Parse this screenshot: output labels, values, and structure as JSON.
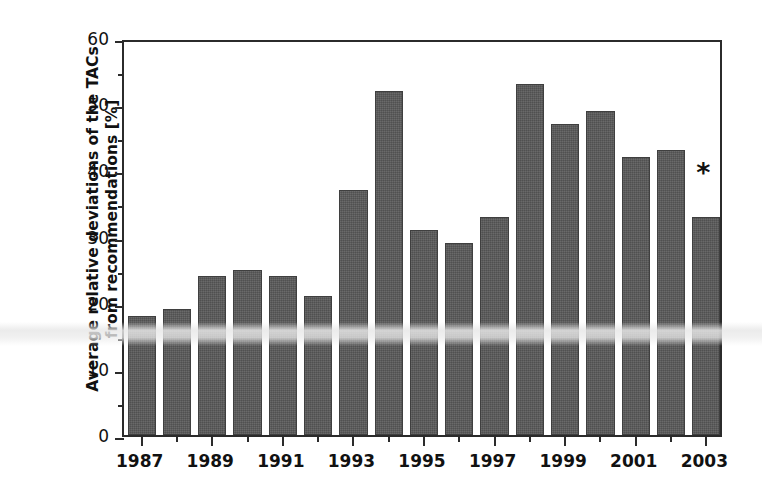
{
  "chart_data": {
    "type": "bar",
    "title": "",
    "subtitle": "",
    "xlabel": "",
    "ylabel": "Average relative deviations of the TACs from recommendations [%]",
    "ylabel_line1": "Average relative deviations of the TACs",
    "ylabel_line2": "from recommendations [%]",
    "categories": [
      "1987",
      "1988",
      "1989",
      "1990",
      "1991",
      "1992",
      "1993",
      "1994",
      "1995",
      "1996",
      "1997",
      "1998",
      "1999",
      "2000",
      "2001",
      "2002",
      "2003"
    ],
    "values": [
      18,
      19,
      24,
      25,
      24,
      21,
      37,
      52,
      31,
      29,
      33,
      53,
      47,
      49,
      42,
      43,
      33
    ],
    "ylim": [
      0,
      60
    ],
    "y_ticks": [
      0,
      10,
      20,
      30,
      40,
      50,
      60
    ],
    "y_tick_labels": [
      "0",
      "10",
      "20",
      "30",
      "40",
      "50",
      "60"
    ],
    "y_minor_step": 5,
    "x_tick_labels": [
      "1987",
      "1989",
      "1991",
      "1993",
      "1995",
      "1997",
      "1999",
      "2001",
      "2003"
    ],
    "x_tick_categories": [
      "1987",
      "1989",
      "1991",
      "1993",
      "1995",
      "1997",
      "1999",
      "2001",
      "2003"
    ],
    "grid": false,
    "legend": false,
    "legend_position": "none",
    "bar_color": "#585858",
    "bar_edge_color": "#3f3f3f",
    "axis_color": "#2b2b2b",
    "background_color": "#ffffff",
    "annotations": [
      {
        "text": "*",
        "category": "2003",
        "value": 40,
        "name": "asterisk-annotation"
      }
    ]
  }
}
